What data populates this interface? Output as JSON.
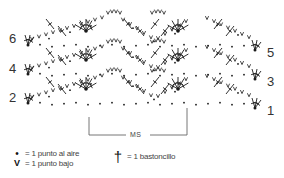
{
  "diagram": {
    "type": "crochet-chart",
    "colors": {
      "ink": "#1a1a1a",
      "bracket": "#666666",
      "text": "#333333"
    },
    "rows_left": [
      {
        "number": "6",
        "x": 9,
        "y": 32
      },
      {
        "number": "4",
        "x": 9,
        "y": 62
      },
      {
        "number": "2",
        "x": 9,
        "y": 91
      }
    ],
    "rows_right": [
      {
        "number": "5",
        "x": 267,
        "y": 46
      },
      {
        "number": "3",
        "x": 267,
        "y": 75
      },
      {
        "number": "1",
        "x": 267,
        "y": 104
      }
    ],
    "repeat": {
      "label": "MS"
    },
    "legend": {
      "chain": {
        "symbol": "•",
        "label": "= 1 punto al aire"
      },
      "single_crochet": {
        "symbol": "V",
        "label": "= 1 punto bajo"
      },
      "double_crochet": {
        "symbol": "†",
        "label": "= 1 bastoncillo"
      }
    }
  }
}
